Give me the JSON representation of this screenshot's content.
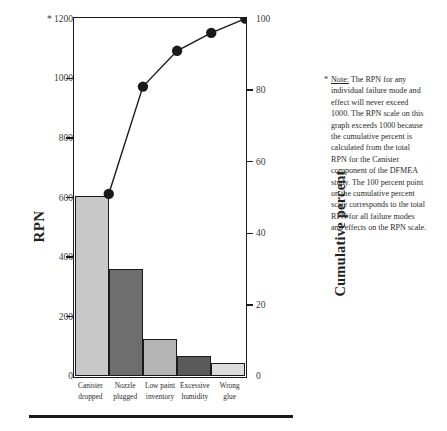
{
  "chart_data": {
    "type": "bar",
    "title": "",
    "subtitle": "",
    "categories": [
      "Canister dropped",
      "Nozzle plugged",
      "Low paint inventory",
      "Excessive humidity",
      "Wrong glue"
    ],
    "category_lines": [
      [
        "Canister",
        "dropped"
      ],
      [
        "Nozzle",
        "plugged"
      ],
      [
        "Low paint",
        "inventory"
      ],
      [
        "Excessive",
        "humidity"
      ],
      [
        "Wrong",
        "glue"
      ]
    ],
    "values": [
      605,
      360,
      125,
      70,
      45
    ],
    "bar_colors": [
      "#c8c8c8",
      "#6e6e6e",
      "#b4b4b4",
      "#5a5a5a",
      "#dcdcdc"
    ],
    "series": [
      {
        "name": "RPN",
        "type": "bar",
        "values": [
          605,
          360,
          125,
          70,
          45
        ]
      },
      {
        "name": "Cumulative percent",
        "type": "line",
        "values": [
          51,
          81,
          91,
          96,
          100
        ]
      }
    ],
    "xlabel": "",
    "ylabel": "RPN",
    "y2label": "Cumulative percent",
    "ylim": [
      0,
      1200
    ],
    "yticks": [
      0,
      200,
      400,
      600,
      800,
      1000,
      1200
    ],
    "ytick_labels": [
      "0",
      "200",
      "400",
      "600",
      "800",
      "1000",
      "1200"
    ],
    "y2lim": [
      0,
      100
    ],
    "y2ticks": [
      0,
      20,
      40,
      60,
      80,
      100
    ],
    "y2tick_labels": [
      "0",
      "20",
      "40",
      "60",
      "80",
      "100"
    ],
    "grid": false,
    "legend": "none",
    "marker": "filled-circle",
    "line_color": "#1a1a1a",
    "axis_color": "#1a1a1a",
    "top_tick_marker": "*"
  },
  "axes": {
    "left": {
      "title": "RPN",
      "ticks": [
        {
          "label": "1200",
          "value": 1200,
          "prefix": "*"
        },
        {
          "label": "1000",
          "value": 1000,
          "prefix": ""
        },
        {
          "label": "800",
          "value": 800,
          "prefix": ""
        },
        {
          "label": "600",
          "value": 600,
          "prefix": ""
        },
        {
          "label": "400",
          "value": 400,
          "prefix": ""
        },
        {
          "label": "200",
          "value": 200,
          "prefix": ""
        },
        {
          "label": "0",
          "value": 0,
          "prefix": ""
        }
      ]
    },
    "right": {
      "title": "Cumulative percent",
      "ticks": [
        {
          "label": "100",
          "value": 100
        },
        {
          "label": "80",
          "value": 80
        },
        {
          "label": "60",
          "value": 60
        },
        {
          "label": "40",
          "value": 40
        },
        {
          "label": "20",
          "value": 20
        },
        {
          "label": "0",
          "value": 0
        }
      ]
    }
  },
  "note": {
    "marker": "*",
    "lead": "Note:",
    "text": " The RPN for any individual failure mode and effect will never exceed 1000. The RPN scale on this graph exceeds 1000 because the cumulative percent is calculated from the total RPN for the Canister component of the DFMEA study. The 100 percent point on the cumulative percent scale corresponds to the total RPN for all failure modes and effects on the RPN scale."
  }
}
